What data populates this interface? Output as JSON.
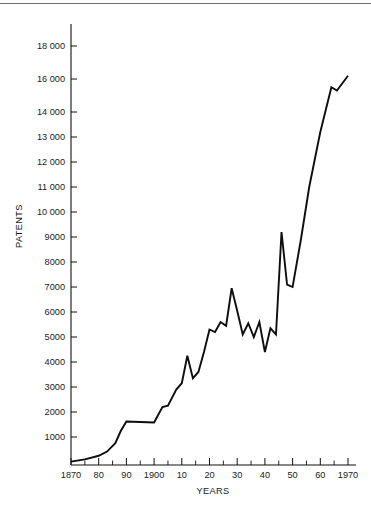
{
  "figure": {
    "background_color": "#ffffff",
    "line_color": "#0d0d0d",
    "axis_color": "#111111",
    "top_rule_color": "#6f6f6f"
  },
  "chart_data": {
    "type": "line",
    "title": "",
    "subtitle": "",
    "xlabel": "YEARS",
    "ylabel": "PATENTS",
    "grid": false,
    "legend": null,
    "xlim": [
      1870,
      1972
    ],
    "ylim": [
      0,
      18800
    ],
    "x_tick_labels": [
      "1870",
      "80",
      "90",
      "1900",
      "10",
      "20",
      "30",
      "40",
      "50",
      "60",
      "1970"
    ],
    "x_tick_values": [
      1870,
      1880,
      1890,
      1900,
      1910,
      1920,
      1930,
      1940,
      1950,
      1960,
      1970
    ],
    "x_minor_tick_step": 5,
    "y_tick_labels": [
      "1000",
      "2000",
      "3000",
      "4000",
      "5000",
      "6000",
      "7000",
      "8000",
      "9000",
      "10 000",
      "11 000",
      "12 000",
      "13 000",
      "14 000",
      "16 000",
      "18 000"
    ],
    "y_tick_values": [
      1000,
      2000,
      3000,
      4000,
      5000,
      6000,
      7000,
      8000,
      9000,
      10000,
      11000,
      12000,
      13000,
      14000,
      16000,
      18000
    ],
    "y_axis_note": "non-uniform spacing: equal steps of 1000 up to 14 000, then 16 000 and 18 000",
    "series": [
      {
        "name": "US patents issued",
        "x": [
          1870,
          1875,
          1880,
          1883,
          1886,
          1888,
          1890,
          1895,
          1900,
          1903,
          1905,
          1908,
          1910,
          1912,
          1914,
          1916,
          1918,
          1920,
          1922,
          1924,
          1926,
          1928,
          1930,
          1932,
          1934,
          1936,
          1938,
          1940,
          1942,
          1944,
          1946,
          1948,
          1950,
          1953,
          1956,
          1960,
          1964,
          1966,
          1970
        ],
        "y": [
          120,
          200,
          330,
          480,
          780,
          1250,
          1620,
          1600,
          1580,
          2200,
          2250,
          2900,
          3150,
          4250,
          3350,
          3600,
          4400,
          5300,
          5200,
          5600,
          5450,
          6950,
          6050,
          5100,
          5550,
          5000,
          5600,
          4400,
          5350,
          5100,
          9200,
          7100,
          7000,
          8900,
          11000,
          13200,
          15500,
          15300,
          16200
        ]
      }
    ]
  },
  "axis_labels": {
    "y_axis_title": "PATENTS",
    "x_axis_title": "YEARS"
  }
}
